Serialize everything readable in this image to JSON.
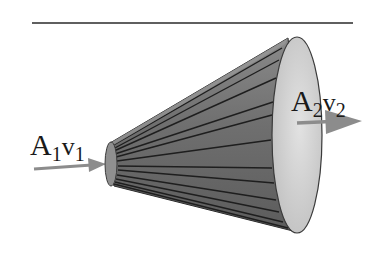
{
  "diagram": {
    "title": "",
    "top_rule": {
      "color": "#2a2a2a"
    },
    "inlet_label": {
      "area": "A",
      "area_sub": "1",
      "velocity": "v",
      "velocity_sub": "1"
    },
    "outlet_label": {
      "area": "A",
      "area_sub": "2",
      "velocity": "v",
      "velocity_sub": "2"
    },
    "colors": {
      "cone_body": "#6e6e6e",
      "cone_stripe": "#1e1e1e",
      "cone_highlight": "#9a9a9a",
      "mouth_fill": "#d4d4d4",
      "arrow": "#8c8c8c"
    }
  }
}
